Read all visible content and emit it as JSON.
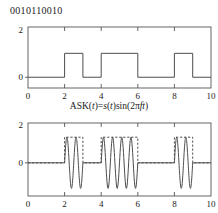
{
  "figure": {
    "bitstream": "0010110010",
    "middle_label": {
      "prefix": "ASK(",
      "var1": "t",
      "mid": ")=",
      "var2": "s",
      "mid2": "(",
      "var3": "t",
      "mid3": ")sin(2π",
      "var4": "f",
      "var5": "t",
      "suffix": ")",
      "full": "ASK(t)=s(t)sin(2πft)"
    },
    "line_color": "#4d4d4d",
    "axis_color": "#555555",
    "background": "#ffffff"
  },
  "chart_data": [
    {
      "id": "baseband-signal",
      "type": "line",
      "title": "",
      "xlabel": "",
      "ylabel": "",
      "xlim": [
        0,
        10
      ],
      "ylim": [
        -0.45,
        2.1
      ],
      "xticks": [
        0,
        2,
        4,
        6,
        8,
        10
      ],
      "xticklabels": [
        "0",
        "2",
        "4",
        "6",
        "8",
        "10"
      ],
      "yticks": [
        0,
        2
      ],
      "yticklabels": [
        "0",
        "2"
      ],
      "grid": false,
      "legend": null,
      "description": "Binary NRZ baseband waveform s(t) for bit sequence 0010110010, one bit per unit time, amplitude 0 or 1",
      "bits": [
        0,
        0,
        1,
        0,
        1,
        1,
        0,
        0,
        1,
        0
      ],
      "bit_duration": 1,
      "high_level": 1,
      "low_level": 0,
      "series": [
        {
          "name": "s(t)",
          "style": "solid",
          "steps": [
            {
              "t_start": 0,
              "t_end": 2,
              "value": 0
            },
            {
              "t_start": 2,
              "t_end": 3,
              "value": 1
            },
            {
              "t_start": 3,
              "t_end": 4,
              "value": 0
            },
            {
              "t_start": 4,
              "t_end": 6,
              "value": 1
            },
            {
              "t_start": 6,
              "t_end": 8,
              "value": 0
            },
            {
              "t_start": 8,
              "t_end": 9,
              "value": 1
            },
            {
              "t_start": 9,
              "t_end": 10,
              "value": 0
            }
          ]
        }
      ]
    },
    {
      "id": "ask-modulated-signal",
      "type": "line",
      "title": "ASK(t)=s(t)sin(2πft)",
      "xlabel": "",
      "ylabel": "",
      "xlim": [
        0,
        10
      ],
      "ylim": [
        -1.75,
        2.1
      ],
      "xticks": [
        0,
        2,
        4,
        6,
        8,
        10
      ],
      "xticklabels": [
        "0",
        "2",
        "4",
        "6",
        "8",
        "10"
      ],
      "yticks": [
        0,
        2
      ],
      "yticklabels": [
        "0",
        "2"
      ],
      "grid": false,
      "legend": null,
      "description": "Amplitude shift keyed carrier: sine bursts of amplitude 1.35 present only where s(t)=1, with dashed rectangular envelope overlaid",
      "carrier_amplitude": 1.35,
      "cycles_per_bit": 2,
      "series": [
        {
          "name": "ASK(t)",
          "style": "solid",
          "bursts": [
            {
              "t_start": 2,
              "t_end": 3,
              "amplitude": 1.35,
              "cycles": 2
            },
            {
              "t_start": 4,
              "t_end": 6,
              "amplitude": 1.35,
              "cycles": 4
            },
            {
              "t_start": 8,
              "t_end": 9,
              "amplitude": 1.35,
              "cycles": 2
            }
          ],
          "zero_segments": [
            {
              "t_start": 0,
              "t_end": 2
            },
            {
              "t_start": 3,
              "t_end": 4
            },
            {
              "t_start": 6,
              "t_end": 8
            },
            {
              "t_start": 9,
              "t_end": 10
            }
          ]
        },
        {
          "name": "envelope",
          "style": "dashed",
          "steps": [
            {
              "t_start": 0,
              "t_end": 2,
              "value": 0
            },
            {
              "t_start": 2,
              "t_end": 3,
              "value": 1.35
            },
            {
              "t_start": 3,
              "t_end": 4,
              "value": 0
            },
            {
              "t_start": 4,
              "t_end": 6,
              "value": 1.35
            },
            {
              "t_start": 6,
              "t_end": 8,
              "value": 0
            },
            {
              "t_start": 8,
              "t_end": 9,
              "value": 1.35
            },
            {
              "t_start": 9,
              "t_end": 10,
              "value": 0
            }
          ]
        }
      ]
    }
  ]
}
